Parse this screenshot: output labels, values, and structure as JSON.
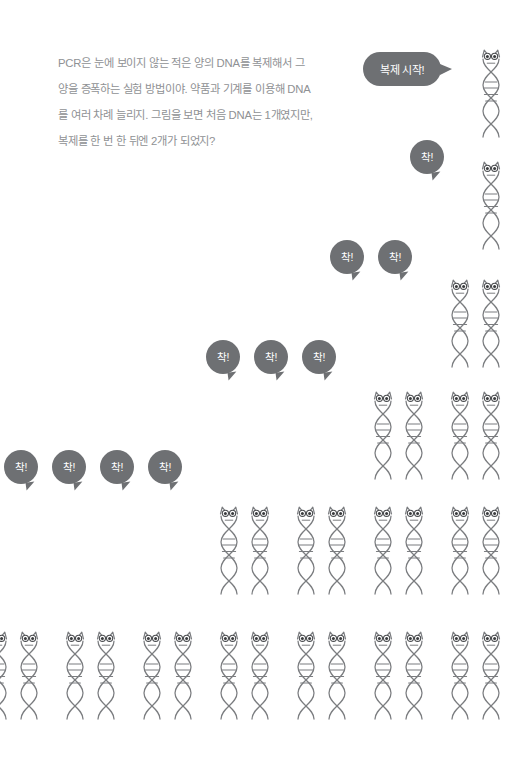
{
  "narration": {
    "text": "PCR은 눈에 보이지 않는 적은 양의 DNA를 복제해서 그\n양을 증폭하는 실험 방법이야. 약품과 기계를 이용해 DNA\n를 여러 차례 늘리지. 그림을 보면 처음 DNA는 1개였지만,\n복제를 한 번 한 뒤엔 2개가 되었지?",
    "color": "#8f9194"
  },
  "bubbles": {
    "start_label": "복제 시작!",
    "chak_label": "착!",
    "fill": "#6e7073",
    "text_color": "#ffffff"
  },
  "dna": {
    "stroke": "#7b7d80",
    "eye_fill": "#3a3c3e",
    "label": "dna-strand"
  },
  "generations": [
    {
      "name": "generation-0",
      "dna_count": 1,
      "bubble_count": 0,
      "bubble_type": "start"
    },
    {
      "name": "generation-1",
      "dna_count": 1,
      "bubble_count": 1,
      "bubble_type": "chak"
    },
    {
      "name": "generation-2",
      "dna_count": 2,
      "bubble_count": 2,
      "bubble_type": "chak"
    },
    {
      "name": "generation-3",
      "dna_count": 4,
      "bubble_count": 3,
      "bubble_type": "chak"
    },
    {
      "name": "generation-4",
      "dna_count": 8,
      "bubble_count": 4,
      "bubble_type": "chak"
    },
    {
      "name": "generation-5",
      "dna_count": 16,
      "bubble_count": 5,
      "bubble_type": "chak"
    }
  ]
}
